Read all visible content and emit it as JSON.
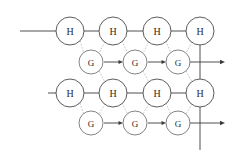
{
  "diagram": {
    "canvas": {
      "width": 238,
      "height": 153,
      "background": "#ffffff"
    },
    "colors": {
      "node_stroke": "#4a4a4a",
      "node_stroke_g": "#6d6d6d",
      "node_fill": "#ffffff",
      "solid_link": "#3c3c3c",
      "dashed_link": "#b4b4b4",
      "label_text": "#2a2a2a"
    },
    "geometry": {
      "h_radius": 14,
      "g_radius": 12,
      "row_y": {
        "h_top": 31,
        "g_top": 62,
        "h_bottom": 93,
        "g_bottom": 123
      },
      "col_x_h": [
        70,
        113,
        157,
        200
      ],
      "col_x_g": [
        91,
        135,
        178
      ]
    },
    "rows": [
      {
        "id": "h-row-top",
        "kind": "hidden-state-row",
        "label_text": "H",
        "y": 31,
        "nodes": [
          {
            "id": "h-top-1",
            "label": "H",
            "cx": 70,
            "cy": 31
          },
          {
            "id": "h-top-2",
            "label": "H",
            "cx": 113,
            "cy": 31
          },
          {
            "id": "h-top-3",
            "label": "H",
            "cx": 157,
            "cy": 31
          },
          {
            "id": "h-top-4",
            "label": "H",
            "cx": 200,
            "cy": 31
          }
        ],
        "lead_in_line": {
          "x1": 20,
          "x2": 56,
          "y": 31
        }
      },
      {
        "id": "g-row-top",
        "kind": "gaussian-row",
        "label_text": "G",
        "y": 62,
        "nodes": [
          {
            "id": "g-top-1",
            "label": "G",
            "cx": 91,
            "cy": 62
          },
          {
            "id": "g-top-2",
            "label": "G",
            "cx": 135,
            "cy": 62
          },
          {
            "id": "g-top-3",
            "label": "G",
            "cx": 178,
            "cy": 62
          }
        ],
        "exit_arrow": {
          "x1": 190,
          "x2": 224,
          "y": 62
        }
      },
      {
        "id": "h-row-bottom",
        "kind": "hidden-state-row",
        "label_text": "H",
        "y": 93,
        "nodes": [
          {
            "id": "h-bot-1",
            "label": "H",
            "cx": 70,
            "cy": 93
          },
          {
            "id": "h-bot-2",
            "label": "H",
            "cx": 113,
            "cy": 93
          },
          {
            "id": "h-bot-3",
            "label": "H",
            "cx": 157,
            "cy": 93
          },
          {
            "id": "h-bot-4",
            "label": "H",
            "cx": 200,
            "cy": 93
          }
        ],
        "lead_in_line": {
          "x1": 48,
          "x2": 56,
          "y": 93
        }
      },
      {
        "id": "g-row-bottom",
        "kind": "gaussian-row",
        "label_text": "G",
        "y": 123,
        "nodes": [
          {
            "id": "g-bot-1",
            "label": "G",
            "cx": 91,
            "cy": 123
          },
          {
            "id": "g-bot-2",
            "label": "G",
            "cx": 135,
            "cy": 123
          },
          {
            "id": "g-bot-3",
            "label": "G",
            "cx": 178,
            "cy": 123
          }
        ],
        "exit_arrow": {
          "x1": 190,
          "x2": 224,
          "y": 123
        }
      }
    ],
    "vertical_spine": {
      "x": 200,
      "y1": 45,
      "y2": 150
    },
    "node_labels": {
      "hidden": "H",
      "gaussian": "G"
    }
  }
}
